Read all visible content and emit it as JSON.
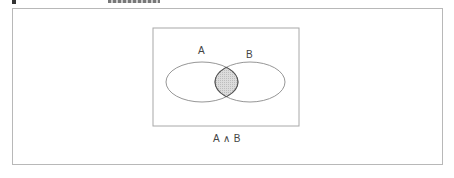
{
  "diagram": {
    "type": "venn",
    "sets": [
      {
        "id": "A",
        "label": "A"
      },
      {
        "id": "B",
        "label": "B"
      }
    ],
    "highlighted_region": "A ∩ B",
    "caption": "A ∧ B",
    "colors": {
      "outline": "#8a8a8a",
      "frame": "#b8b8b8",
      "universe_border": "#a8a8a8",
      "intersection_fill": "#d4d4d4",
      "intersection_outline": "#555555"
    }
  }
}
